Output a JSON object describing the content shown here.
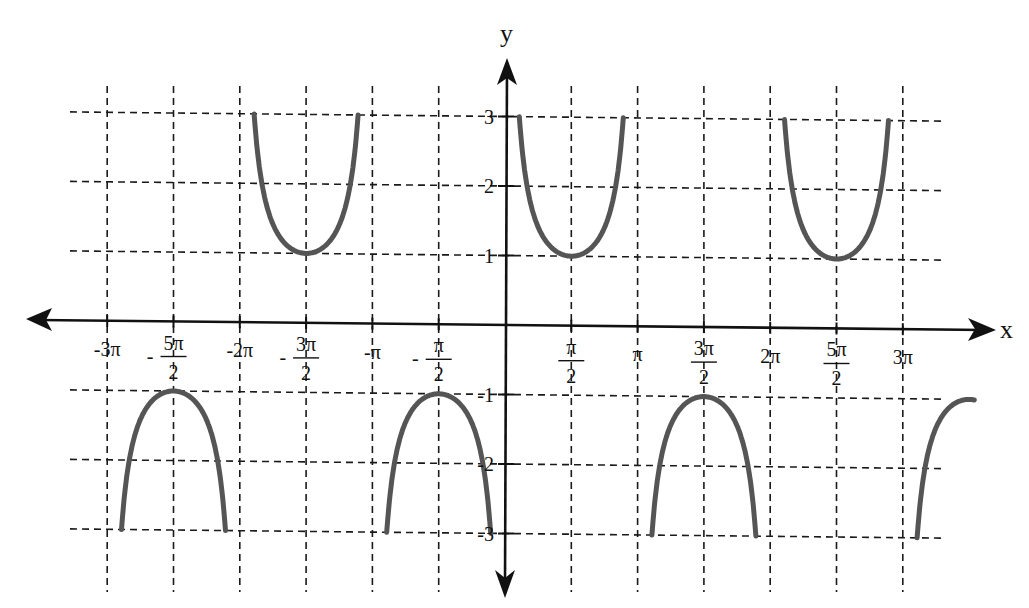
{
  "chart_data": {
    "type": "line",
    "title": "",
    "function": "y = csc(x)",
    "xlabel": "x",
    "ylabel": "y",
    "xlim": [
      -9.42478,
      9.42478
    ],
    "ylim": [
      -3,
      3
    ],
    "grid": true,
    "grid_style": "dashed",
    "legend": null,
    "x_ticks": [
      {
        "value": -9.42478,
        "label_top": "-3π",
        "label_bottom": ""
      },
      {
        "value": -7.85398,
        "label_top": "5π",
        "label_bottom": "2",
        "negative_fraction": true
      },
      {
        "value": -6.28319,
        "label_top": "-2π",
        "label_bottom": ""
      },
      {
        "value": -4.71239,
        "label_top": "3π",
        "label_bottom": "2",
        "negative_fraction": true
      },
      {
        "value": -3.14159,
        "label_top": "-π",
        "label_bottom": ""
      },
      {
        "value": -1.5708,
        "label_top": "π",
        "label_bottom": "2",
        "negative_fraction": true
      },
      {
        "value": 1.5708,
        "label_top": "π",
        "label_bottom": "2",
        "negative_fraction": false
      },
      {
        "value": 3.14159,
        "label_top": "π",
        "label_bottom": ""
      },
      {
        "value": 4.71239,
        "label_top": "3π",
        "label_bottom": "2",
        "negative_fraction": false
      },
      {
        "value": 6.28319,
        "label_top": "2π",
        "label_bottom": ""
      },
      {
        "value": 7.85398,
        "label_top": "5π",
        "label_bottom": "2",
        "negative_fraction": false
      },
      {
        "value": 9.42478,
        "label_top": "3π",
        "label_bottom": ""
      }
    ],
    "y_ticks": [
      {
        "value": 3,
        "label": "3"
      },
      {
        "value": 2,
        "label": "2"
      },
      {
        "value": 1,
        "label": "1"
      },
      {
        "value": -1,
        "label": "-1"
      },
      {
        "value": -2,
        "label": "-2"
      },
      {
        "value": -3,
        "label": "-3"
      }
    ],
    "series": [
      {
        "name": "csc(x)",
        "color": "#555555",
        "branches": [
          {
            "interval": [
              "-3π",
              "-2π"
            ],
            "shape": "downward arch",
            "vertex": {
              "x": "-5π/2",
              "y": -1
            },
            "ends_y": -3
          },
          {
            "interval": [
              "-2π",
              "-π"
            ],
            "shape": "upward U",
            "vertex": {
              "x": "-3π/2",
              "y": 1
            },
            "ends_y": 3
          },
          {
            "interval": [
              "-π",
              "0"
            ],
            "shape": "downward arch",
            "vertex": {
              "x": "-π/2",
              "y": -1
            },
            "ends_y": -3
          },
          {
            "interval": [
              "0",
              "π"
            ],
            "shape": "upward U",
            "vertex": {
              "x": "π/2",
              "y": 1
            },
            "ends_y": 3
          },
          {
            "interval": [
              "π",
              "2π"
            ],
            "shape": "downward arch",
            "vertex": {
              "x": "3π/2",
              "y": -1
            },
            "ends_y": -3
          },
          {
            "interval": [
              "2π",
              "3π"
            ],
            "shape": "upward U",
            "vertex": {
              "x": "5π/2",
              "y": 1
            },
            "ends_y": 3
          },
          {
            "interval": [
              "3π",
              "4π (clipped)"
            ],
            "shape": "downward arch",
            "vertex": {
              "x": "7π/2",
              "y": -1
            },
            "ends_y": -3,
            "note": "partial branch at right edge"
          }
        ]
      }
    ],
    "sample_points": [
      {
        "x": "π/6",
        "y": 2
      },
      {
        "x": "π/2",
        "y": 1
      },
      {
        "x": "5π/6",
        "y": 2
      },
      {
        "x": "-π/6",
        "y": -2
      },
      {
        "x": "-π/2",
        "y": -1
      },
      {
        "x": "-5π/6",
        "y": -2
      },
      {
        "x": "3π/2",
        "y": -1
      },
      {
        "x": "-3π/2",
        "y": 1
      },
      {
        "x": "5π/2",
        "y": 1
      },
      {
        "x": "-5π/2",
        "y": -1
      }
    ]
  },
  "labels": {
    "x_axis": "x",
    "y_axis": "y",
    "minus": "-"
  },
  "style": {
    "curve_color": "#555555",
    "axis_color": "#111111",
    "grid_color": "#1a1a1a",
    "background": "#ffffff"
  }
}
